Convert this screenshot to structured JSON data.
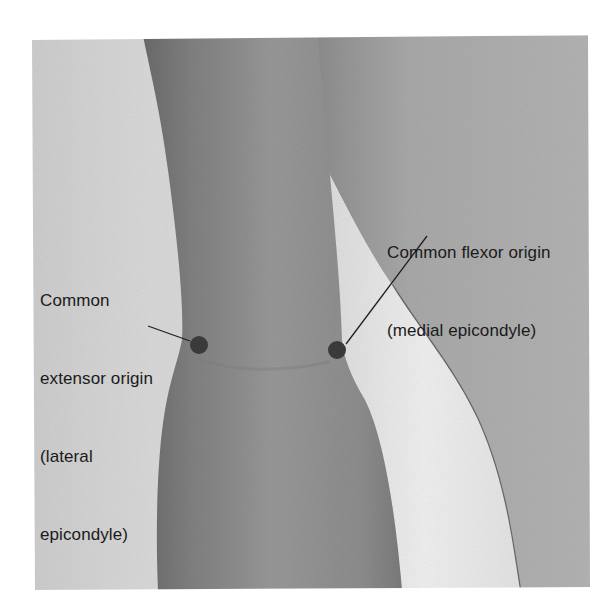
{
  "figure": {
    "type": "anatomical-photograph",
    "colors": {
      "page_background": "#ffffff",
      "sheet_background": "#cfcfcf",
      "forearm_skin": "#8e8e8e",
      "forearm_shadow": "#6e6e6e",
      "upper_arm_skin": "#a4a4a4",
      "gap_highlight": "#e9e9e9",
      "marker_dot": "#3a3a3a",
      "leader_line": "#1f1f1f",
      "label_text": "#1a1a1a"
    },
    "markers": [
      {
        "id": "lateral",
        "cx": 199,
        "cy": 345,
        "r": 9,
        "leader": {
          "x1": 148,
          "y1": 326,
          "x2": 190,
          "y2": 341
        },
        "label": {
          "lines": [
            "Common",
            "extensor origin",
            "(lateral",
            "epicondyle)"
          ]
        }
      },
      {
        "id": "medial",
        "cx": 337,
        "cy": 350,
        "r": 9,
        "leader": {
          "x1": 427,
          "y1": 236,
          "x2": 346,
          "y2": 344
        },
        "label": {
          "lines": [
            "Common flexor origin",
            "(medial epicondyle)"
          ]
        }
      }
    ]
  }
}
